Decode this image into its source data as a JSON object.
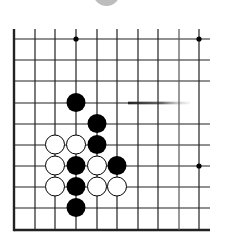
{
  "board": {
    "columns": 10,
    "rows": 10,
    "x_coords": [
      14,
      35,
      55,
      76,
      97,
      117,
      138,
      158,
      179,
      199
    ],
    "y_coords": [
      39,
      60,
      81,
      103,
      124,
      145,
      166,
      187,
      208,
      230
    ],
    "edges": {
      "left": true,
      "bottom": true,
      "top": false,
      "right": false
    },
    "line_color": "#222222",
    "stone_radius": 9.5,
    "star_points": [
      {
        "col": 3,
        "row": 0
      },
      {
        "col": 9,
        "row": 0
      },
      {
        "col": 9,
        "row": 6
      }
    ],
    "stones": [
      {
        "color": "black",
        "col": 3,
        "row": 3
      },
      {
        "color": "black",
        "col": 4,
        "row": 4
      },
      {
        "color": "white",
        "col": 2,
        "row": 5
      },
      {
        "color": "white",
        "col": 3,
        "row": 5
      },
      {
        "color": "black",
        "col": 4,
        "row": 5
      },
      {
        "color": "white",
        "col": 2,
        "row": 6
      },
      {
        "color": "black",
        "col": 3,
        "row": 6
      },
      {
        "color": "white",
        "col": 4,
        "row": 6
      },
      {
        "color": "black",
        "col": 5,
        "row": 6
      },
      {
        "color": "white",
        "col": 2,
        "row": 7
      },
      {
        "color": "black",
        "col": 3,
        "row": 7
      },
      {
        "color": "white",
        "col": 4,
        "row": 7
      },
      {
        "color": "white",
        "col": 5,
        "row": 7
      },
      {
        "color": "black",
        "col": 3,
        "row": 8
      }
    ],
    "colors": {
      "black_stone": "#000000",
      "white_stone": "#ffffff",
      "top_shape": "#bdbdbd"
    }
  }
}
